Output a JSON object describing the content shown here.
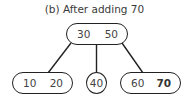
{
  "title": "(b) After adding 70",
  "tree": {
    "root": {
      "keys": [
        "30",
        "50"
      ]
    },
    "children": [
      {
        "keys": [
          "10",
          "20"
        ],
        "highlight": []
      },
      {
        "keys": [
          "40"
        ],
        "highlight": []
      },
      {
        "keys": [
          "60",
          "70"
        ],
        "highlight": [
          "70"
        ]
      }
    ]
  },
  "colors": {
    "stroke": "#222222",
    "text": "#444444",
    "highlight_text": "#333333"
  }
}
